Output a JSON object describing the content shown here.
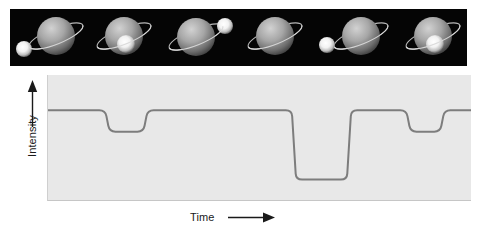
{
  "figure": {
    "background": "#ffffff",
    "caption_present": false
  },
  "filmstrip": {
    "name": "orbit-phase-sequence",
    "background": "#050505",
    "planet_color": "#9a9a9a",
    "star_color": "#ffffff",
    "ring_color": "#d8d8d8",
    "frames": [
      {
        "label": "phase-1-star-left-of-planet",
        "star_position": "left",
        "star_visible": true,
        "star_x": 14,
        "star_y": 40,
        "star_r": 8,
        "planet_x": 46,
        "planet_y": 27,
        "planet_r": 19
      },
      {
        "label": "phase-2-star-transiting-front",
        "star_position": "front-center",
        "star_visible": true,
        "star_x": 40,
        "star_y": 35,
        "star_r": 9,
        "planet_x": 38,
        "planet_y": 27,
        "planet_r": 19
      },
      {
        "label": "phase-3-star-upper-right",
        "star_position": "upper-right",
        "star_visible": true,
        "star_x": 63,
        "star_y": 17,
        "star_r": 8,
        "planet_x": 34,
        "planet_y": 28,
        "planet_r": 19
      },
      {
        "label": "phase-4-star-eclipsed-behind",
        "star_position": "behind",
        "star_visible": false,
        "star_x": 0,
        "star_y": 0,
        "star_r": 0,
        "planet_x": 36,
        "planet_y": 27,
        "planet_r": 19
      },
      {
        "label": "phase-5-star-left-of-planet",
        "star_position": "left",
        "star_visible": true,
        "star_x": 12,
        "star_y": 36,
        "star_r": 8,
        "planet_x": 46,
        "planet_y": 27,
        "planet_r": 19
      },
      {
        "label": "phase-6-star-transiting-front",
        "star_position": "front-center",
        "star_visible": true,
        "star_x": 44,
        "star_y": 35,
        "star_r": 9,
        "planet_x": 42,
        "planet_y": 27,
        "planet_r": 19
      }
    ]
  },
  "chart_data": {
    "type": "line",
    "title": "",
    "xlabel": "Time",
    "ylabel": "Intensity",
    "xlim": [
      0,
      100
    ],
    "ylim": [
      0,
      100
    ],
    "grid": false,
    "legend": "none",
    "axis_ticks": "none",
    "line_color": "#7d7d7d",
    "line_width": 2,
    "plot_background": "#e8e8e8",
    "baseline_level": 72,
    "shallow_dip_level": 55,
    "deep_dip_level": 17,
    "events": [
      {
        "name": "shallow-dip-1",
        "kind": "transit",
        "x_start": 14,
        "x_end": 23,
        "depth_level": 55
      },
      {
        "name": "deep-dip",
        "kind": "secondary-eclipse",
        "x_start": 58,
        "x_end": 71,
        "depth_level": 17
      },
      {
        "name": "shallow-dip-2",
        "kind": "transit",
        "x_start": 85,
        "x_end": 93,
        "depth_level": 55
      }
    ],
    "series": [
      {
        "name": "intensity",
        "x": [
          0,
          13.5,
          14.5,
          22.5,
          23.5,
          57.5,
          58.5,
          70.5,
          71.5,
          84.5,
          85.5,
          92.5,
          93.5,
          100
        ],
        "y": [
          72,
          72,
          55,
          55,
          72,
          72,
          17,
          17,
          72,
          72,
          55,
          55,
          72,
          72
        ]
      }
    ]
  },
  "axes": {
    "y_arrow_icon": "up-arrow-icon",
    "x_arrow_icon": "right-arrow-icon",
    "y_label_text": "Intensity",
    "x_label_text": "Time"
  }
}
